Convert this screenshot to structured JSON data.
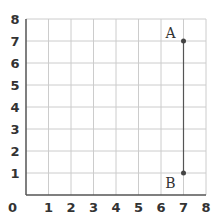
{
  "diagram": {
    "type": "coordinate-grid",
    "x_range": [
      0,
      8
    ],
    "y_range": [
      0,
      8
    ],
    "x_ticks": [
      "0",
      "1",
      "2",
      "3",
      "4",
      "5",
      "6",
      "7",
      "8"
    ],
    "y_ticks": [
      "1",
      "2",
      "3",
      "4",
      "5",
      "6",
      "7",
      "8"
    ],
    "origin_label": "0",
    "points": [
      {
        "label": "A",
        "x": 7,
        "y": 7
      },
      {
        "label": "B",
        "x": 7,
        "y": 1
      }
    ],
    "segments": [
      {
        "from": "A",
        "to": "B"
      }
    ],
    "colors": {
      "grid": "#cccccc",
      "axis": "#555555",
      "point": "#444444",
      "text": "#333333"
    }
  }
}
